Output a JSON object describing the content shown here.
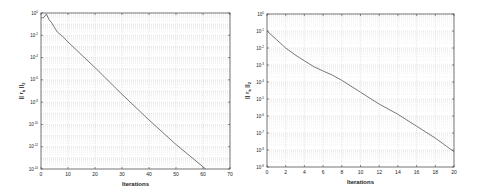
{
  "chart_data": [
    {
      "type": "line",
      "title": "",
      "xlabel": "Iterations",
      "ylabel": "|| r_k ||_2",
      "yscale": "log",
      "xlim": [
        0,
        70
      ],
      "ylim_exponents": [
        -14,
        0
      ],
      "grid": true,
      "xticks": [
        0,
        10,
        20,
        30,
        40,
        50,
        60,
        70
      ],
      "yticks": [
        "10^0",
        "10^-2",
        "10^-4",
        "10^-6",
        "10^-8",
        "10^-10",
        "10^-12",
        "10^-14"
      ],
      "ytick_exponents": [
        0,
        -2,
        -4,
        -6,
        -8,
        -10,
        -12,
        -14
      ],
      "series": [
        {
          "name": "residual",
          "color": "#555555",
          "x": [
            0,
            1,
            2,
            3,
            4,
            5,
            6,
            8,
            10,
            20,
            30,
            40,
            50,
            61
          ],
          "log10_y": [
            -0.45,
            -0.4,
            -0.1,
            -0.6,
            -0.9,
            -1.3,
            -1.7,
            -2.1,
            -2.6,
            -4.9,
            -7.3,
            -9.6,
            -11.8,
            -14
          ]
        }
      ]
    },
    {
      "type": "line",
      "title": "",
      "xlabel": "Iterations",
      "ylabel": "|| r_k ||_2",
      "yscale": "log",
      "xlim": [
        0,
        20
      ],
      "ylim_exponents": [
        -9,
        0
      ],
      "grid": true,
      "xticks": [
        0,
        2,
        4,
        6,
        8,
        10,
        12,
        14,
        16,
        18,
        20
      ],
      "yticks": [
        "10^0",
        "10^-1",
        "10^-2",
        "10^-3",
        "10^-4",
        "10^-5",
        "10^-6",
        "10^-7",
        "10^-8",
        "10^-9"
      ],
      "ytick_exponents": [
        0,
        -1,
        -2,
        -3,
        -4,
        -5,
        -6,
        -7,
        -8,
        -9
      ],
      "series": [
        {
          "name": "residual",
          "color": "#555555",
          "x": [
            0,
            1,
            2,
            3,
            4,
            5,
            6,
            7,
            8,
            10,
            12,
            14,
            16,
            18,
            20
          ],
          "log10_y": [
            -1.0,
            -1.5,
            -2.0,
            -2.4,
            -2.75,
            -3.1,
            -3.35,
            -3.6,
            -3.9,
            -4.6,
            -5.3,
            -5.9,
            -6.6,
            -7.3,
            -8.1
          ]
        }
      ]
    }
  ]
}
